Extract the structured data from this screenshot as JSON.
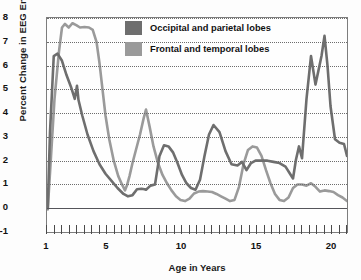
{
  "chart_data": {
    "type": "line",
    "title": "",
    "xlabel": "Age in Years",
    "ylabel": "Percent Change in EEG Energy",
    "xlim": [
      1,
      21
    ],
    "ylim": [
      -1,
      8
    ],
    "xticks": [
      1,
      5,
      10,
      15,
      20
    ],
    "xtick_labels": [
      "1",
      "5",
      "10",
      "15",
      "20"
    ],
    "yticks": [
      -1,
      0,
      1,
      2,
      3,
      4,
      5,
      6,
      7,
      8
    ],
    "ytick_labels": [
      "-1",
      "0",
      "1",
      "2",
      "3",
      "4",
      "5",
      "6",
      "7",
      "8"
    ],
    "grid": "horizontal-dotted",
    "legend_position": "top-center-inside",
    "minor_tick_interval": 0.5,
    "series": [
      {
        "name": "Occipital and parietal lobes",
        "color": "#6e6e6e",
        "x": [
          1.05,
          1.2,
          1.45,
          1.7,
          2.0,
          2.3,
          2.6,
          2.85,
          3.0,
          3.1,
          3.35,
          3.7,
          4.1,
          4.5,
          4.9,
          5.3,
          5.7,
          6.1,
          6.4,
          6.7,
          7.0,
          7.3,
          7.5,
          7.6,
          7.9,
          8.2,
          8.5,
          8.8,
          9.1,
          9.4,
          9.7,
          10.0,
          10.3,
          10.6,
          10.9,
          11.2,
          11.5,
          11.8,
          12.1,
          12.5,
          12.9,
          13.3,
          13.7,
          14.0,
          14.3,
          14.6,
          14.9,
          15.3,
          15.7,
          16.1,
          16.5,
          16.9,
          17.2,
          17.4,
          17.6,
          17.8,
          18.0,
          18.3,
          18.6,
          18.9,
          19.1,
          19.3,
          19.5,
          19.7,
          19.9,
          20.2,
          20.5,
          20.8,
          21.0
        ],
        "y": [
          0.0,
          3.2,
          6.4,
          6.5,
          6.2,
          5.6,
          5.1,
          4.6,
          5.15,
          4.55,
          3.9,
          3.1,
          2.4,
          1.85,
          1.45,
          1.15,
          0.85,
          0.6,
          0.5,
          0.55,
          0.8,
          0.82,
          0.8,
          0.78,
          0.95,
          1.0,
          2.2,
          2.65,
          2.6,
          2.35,
          1.9,
          1.4,
          1.05,
          0.85,
          0.78,
          1.2,
          2.2,
          3.1,
          3.5,
          3.2,
          2.4,
          1.85,
          1.8,
          1.95,
          1.6,
          1.9,
          2.0,
          2.0,
          2.0,
          1.95,
          1.9,
          1.75,
          1.45,
          1.25,
          2.05,
          2.6,
          2.1,
          4.6,
          6.4,
          5.2,
          5.8,
          6.4,
          7.25,
          6.0,
          4.3,
          2.9,
          2.75,
          2.7,
          2.2
        ]
      },
      {
        "name": "Frontal and temporal lobes",
        "color": "#9a9a9a",
        "x": [
          1.05,
          1.25,
          1.5,
          1.8,
          2.0,
          2.2,
          2.45,
          2.7,
          2.95,
          3.2,
          3.5,
          3.8,
          4.05,
          4.3,
          4.5,
          4.7,
          4.9,
          5.15,
          5.45,
          5.75,
          6.0,
          6.2,
          6.35,
          6.5,
          6.7,
          6.95,
          7.2,
          7.45,
          7.6,
          7.85,
          8.1,
          8.4,
          8.7,
          9.0,
          9.3,
          9.6,
          9.9,
          10.2,
          10.5,
          10.8,
          11.1,
          11.4,
          11.7,
          12.0,
          12.3,
          12.6,
          12.9,
          13.2,
          13.5,
          13.8,
          14.1,
          14.4,
          14.7,
          15.0,
          15.3,
          15.6,
          15.9,
          16.2,
          16.5,
          16.8,
          17.1,
          17.4,
          17.7,
          18.0,
          18.3,
          18.6,
          18.9,
          19.2,
          19.5,
          19.8,
          20.1,
          20.4,
          20.7,
          21.0
        ],
        "y": [
          -0.05,
          2.0,
          4.6,
          6.6,
          7.6,
          7.75,
          7.6,
          7.78,
          7.7,
          7.6,
          7.62,
          7.6,
          7.5,
          7.0,
          6.1,
          5.0,
          3.9,
          2.9,
          2.0,
          1.35,
          1.0,
          0.75,
          1.0,
          1.35,
          1.9,
          2.5,
          3.1,
          3.8,
          4.15,
          3.4,
          2.6,
          1.9,
          1.4,
          1.05,
          0.75,
          0.5,
          0.35,
          0.3,
          0.4,
          0.62,
          0.7,
          0.72,
          0.7,
          0.68,
          0.6,
          0.5,
          0.4,
          0.3,
          0.35,
          0.9,
          1.85,
          2.45,
          2.6,
          2.55,
          2.2,
          1.6,
          1.05,
          0.6,
          0.35,
          0.3,
          0.45,
          0.85,
          1.0,
          1.0,
          0.95,
          1.05,
          0.9,
          0.7,
          0.75,
          0.72,
          0.68,
          0.55,
          0.45,
          0.3
        ]
      }
    ]
  },
  "legend": {
    "items": [
      {
        "label": "Occipital and parietal lobes",
        "color": "#6e6e6e"
      },
      {
        "label": "Frontal and temporal lobes",
        "color": "#9a9a9a"
      }
    ]
  }
}
